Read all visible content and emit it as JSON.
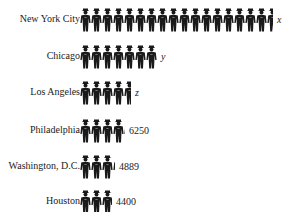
{
  "chart_data": {
    "type": "pictograph",
    "title": "",
    "icon": "police-officer-icon",
    "categories": [
      "New York City",
      "Chicago",
      "Los Angeles",
      "Philadelphia",
      "Washington, D.C.",
      "Houston"
    ],
    "value_labels": [
      "x",
      "y",
      "z",
      "6250",
      "4889",
      "4400"
    ],
    "values": [
      null,
      null,
      null,
      6250,
      4889,
      4400
    ],
    "icon_counts": [
      17.5,
      7,
      4.6,
      4.1,
      3.2,
      2.9
    ],
    "color": "#1a1a1a"
  },
  "rows": [
    {
      "label": "New York City",
      "value": "x",
      "icons": 17.5,
      "italic": true
    },
    {
      "label": "Chicago",
      "value": "y",
      "icons": 7,
      "italic": true
    },
    {
      "label": "Los Angeles",
      "value": "z",
      "icons": 4.6,
      "italic": true
    },
    {
      "label": "Philadelphia",
      "value": "6250",
      "icons": 4.1,
      "italic": false
    },
    {
      "label": "Washington, D.C.",
      "value": "4889",
      "icons": 3.2,
      "italic": false
    },
    {
      "label": "Houston",
      "value": "4400",
      "icons": 2.9,
      "italic": false
    }
  ]
}
